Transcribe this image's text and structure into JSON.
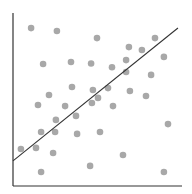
{
  "chart_data": {
    "type": "scatter",
    "title": "",
    "xlabel": "",
    "ylabel": "",
    "grid": false,
    "legend": null,
    "xlim": [
      0,
      100
    ],
    "ylim": [
      0,
      100
    ],
    "x_ticks": [],
    "y_ticks": [],
    "series": [
      {
        "name": "points",
        "color": "#a8a8a8",
        "points": [
          [
            10.7,
            91.3
          ],
          [
            26.0,
            89.6
          ],
          [
            49.7,
            85.5
          ],
          [
            84.0,
            85.5
          ],
          [
            68.6,
            80.3
          ],
          [
            76.3,
            78.6
          ],
          [
            89.3,
            74.6
          ],
          [
            17.8,
            70.5
          ],
          [
            34.3,
            71.7
          ],
          [
            46.2,
            70.8
          ],
          [
            58.6,
            68.6
          ],
          [
            66.9,
            72.8
          ],
          [
            66.9,
            65.9
          ],
          [
            81.7,
            64.2
          ],
          [
            34.9,
            57.2
          ],
          [
            47.3,
            55.5
          ],
          [
            56.2,
            56.6
          ],
          [
            69.2,
            54.9
          ],
          [
            21.3,
            52.6
          ],
          [
            50.3,
            50.9
          ],
          [
            78.7,
            52.0
          ],
          [
            14.8,
            46.8
          ],
          [
            30.8,
            46.2
          ],
          [
            46.7,
            48.0
          ],
          [
            59.2,
            46.2
          ],
          [
            25.4,
            38.2
          ],
          [
            37.3,
            40.5
          ],
          [
            16.6,
            31.2
          ],
          [
            24.9,
            31.2
          ],
          [
            37.9,
            30.1
          ],
          [
            51.5,
            31.2
          ],
          [
            91.7,
            35.8
          ],
          [
            4.7,
            21.4
          ],
          [
            13.6,
            22.0
          ],
          [
            23.7,
            19.1
          ],
          [
            65.1,
            17.9
          ],
          [
            45.6,
            11.6
          ],
          [
            16.6,
            8.1
          ],
          [
            89.3,
            8.1
          ]
        ]
      }
    ],
    "trend_line": {
      "color": "#333333",
      "start": [
        0,
        14.5
      ],
      "end": [
        97.6,
        91.3
      ]
    }
  },
  "colors": {
    "axis": "#333333",
    "point": "#a8a8a8",
    "trend": "#333333",
    "background": "#ffffff"
  }
}
